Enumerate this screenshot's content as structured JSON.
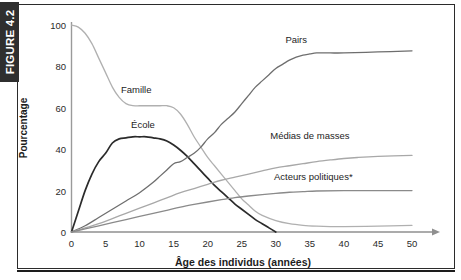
{
  "figure": {
    "tab_label": "FIGURE 4.2"
  },
  "chart_data": {
    "type": "line",
    "title": "",
    "xlabel": "Âge des individus (années)",
    "ylabel": "Pourcentage",
    "xlim": [
      0,
      50
    ],
    "ylim": [
      0,
      100
    ],
    "xticks": [
      "0",
      "5",
      "10",
      "15",
      "20",
      "25",
      "30",
      "35",
      "40",
      "45",
      "50"
    ],
    "yticks": [
      "0",
      "20",
      "40",
      "60",
      "80",
      "100"
    ],
    "grid": false,
    "legend_position": "inline-labels",
    "annotations": [
      "Acteurs politiques*"
    ],
    "series": [
      {
        "name": "Famille",
        "color": "#b0b0b0",
        "label_x": 9.5,
        "label_y": 69,
        "x": [
          0,
          1,
          2,
          3,
          4,
          5,
          6,
          7,
          8,
          9,
          10,
          11,
          12,
          13,
          14,
          15,
          16,
          17,
          18,
          19,
          20,
          21,
          22,
          23,
          24,
          25,
          26,
          27,
          28,
          30,
          32,
          34,
          36,
          38,
          40,
          45,
          50
        ],
        "values": [
          100,
          99,
          96,
          91,
          84,
          77,
          70,
          65,
          62,
          61,
          61,
          61,
          61,
          61,
          61,
          60,
          57,
          52,
          46,
          41,
          36,
          32,
          28,
          24,
          20,
          16,
          13,
          10,
          8,
          5.5,
          4,
          3.2,
          2.8,
          2.6,
          2.6,
          2.8,
          3.2
        ]
      },
      {
        "name": "École",
        "color": "#2b2b2b",
        "label_x": 10.5,
        "label_y": 52,
        "x": [
          0,
          1,
          2,
          3,
          4,
          5,
          6,
          7,
          8,
          9,
          10,
          11,
          12,
          13,
          14,
          15,
          16,
          17,
          18,
          19,
          20,
          21,
          22,
          23,
          24,
          25,
          26,
          27,
          28,
          29,
          30
        ],
        "values": [
          0,
          10,
          20,
          28,
          34,
          38,
          43,
          45,
          45.5,
          46,
          46,
          46,
          45.5,
          45,
          44,
          42,
          39.5,
          36.5,
          33,
          29.5,
          26,
          22.5,
          19.5,
          16.5,
          13.5,
          11,
          8.5,
          6,
          4,
          2,
          0
        ]
      },
      {
        "name": "Pairs",
        "color": "#6e6e6e",
        "label_x": 33,
        "label_y": 93,
        "x": [
          0,
          2,
          4,
          6,
          8,
          10,
          12,
          13,
          14,
          15,
          16,
          17,
          18,
          19,
          20,
          21,
          22,
          23,
          24,
          25,
          26,
          27,
          28,
          29,
          30,
          31,
          32,
          33,
          34,
          35,
          36,
          38,
          40,
          45,
          50
        ],
        "values": [
          0,
          3,
          7,
          11,
          15,
          19,
          24,
          27,
          30,
          33,
          34,
          36,
          38,
          41,
          45,
          48,
          52,
          55,
          58,
          62,
          66,
          70,
          73,
          76,
          79,
          81,
          83,
          84.5,
          85.5,
          86,
          86.5,
          86.5,
          86.5,
          87,
          87.5
        ]
      },
      {
        "name": "Médias de masses",
        "color": "#a8a8a8",
        "label_x": 35,
        "label_y": 47,
        "x": [
          0,
          2,
          4,
          6,
          8,
          10,
          12,
          14,
          16,
          18,
          20,
          22,
          24,
          26,
          28,
          30,
          32,
          34,
          36,
          38,
          40,
          42,
          45,
          50
        ],
        "values": [
          0,
          2,
          4,
          6.5,
          9,
          11.5,
          14,
          16.5,
          19,
          21,
          23,
          25,
          26.5,
          28,
          29.5,
          31,
          32,
          33,
          34,
          34.8,
          35.5,
          36,
          36.5,
          37
        ]
      },
      {
        "name": "Acteurs politiques*",
        "color": "#8a8a8a",
        "label_x": 35.5,
        "label_y": 27,
        "x": [
          0,
          2,
          4,
          6,
          8,
          10,
          12,
          14,
          16,
          18,
          20,
          22,
          24,
          26,
          28,
          30,
          32,
          34,
          36,
          40,
          45,
          50
        ],
        "values": [
          0,
          1.5,
          3,
          4.5,
          6,
          7.5,
          9,
          10.5,
          12,
          13.3,
          14.5,
          15.6,
          16.6,
          17.4,
          18.1,
          18.7,
          19.2,
          19.5,
          19.8,
          20,
          20,
          20
        ]
      }
    ]
  }
}
